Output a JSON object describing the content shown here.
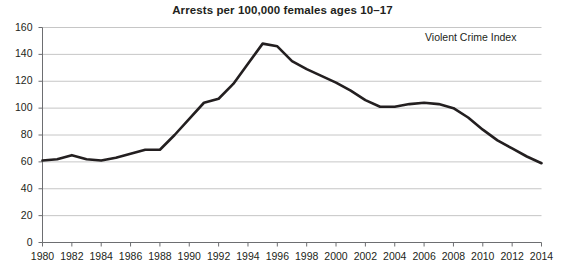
{
  "chart_data": {
    "type": "line",
    "title": "Arrests per 100,000 females ages 10–17",
    "xlabel": "",
    "ylabel": "",
    "xlim": [
      1980,
      2014
    ],
    "ylim": [
      0,
      160
    ],
    "grid": true,
    "legend_position": "top-right",
    "legend": [
      "Violent Crime Index"
    ],
    "series": [
      {
        "name": "Violent Crime Index",
        "color": "#231f20",
        "x": [
          1980,
          1981,
          1982,
          1983,
          1984,
          1985,
          1986,
          1987,
          1988,
          1989,
          1990,
          1991,
          1992,
          1993,
          1994,
          1995,
          1996,
          1997,
          1998,
          1999,
          2000,
          2001,
          2002,
          2003,
          2004,
          2005,
          2006,
          2007,
          2008,
          2009,
          2010,
          2011,
          2012,
          2013,
          2014
        ],
        "values": [
          61,
          62,
          65,
          62,
          61,
          63,
          66,
          69,
          69,
          80,
          92,
          104,
          107,
          118,
          133,
          148,
          146,
          135,
          129,
          124,
          119,
          113,
          106,
          101,
          101,
          103,
          104,
          103,
          100,
          93,
          84,
          76,
          70,
          64,
          59
        ]
      }
    ],
    "x_ticks": [
      1980,
      1982,
      1984,
      1986,
      1988,
      1990,
      1992,
      1994,
      1996,
      1998,
      2000,
      2002,
      2004,
      2006,
      2008,
      2010,
      2012,
      2014
    ],
    "x_tick_labels": [
      "1980",
      "1982",
      "1984",
      "1986",
      "1988",
      "1990",
      "1992",
      "1994",
      "1996",
      "1998",
      "2000",
      "2002",
      "2004",
      "2006",
      "2008",
      "2010",
      "2012",
      "2014"
    ],
    "y_ticks": [
      0,
      20,
      40,
      60,
      80,
      100,
      120,
      140,
      160
    ],
    "y_tick_labels": [
      "0",
      "20",
      "40",
      "60",
      "80",
      "100",
      "120",
      "140",
      "160"
    ],
    "colors": {
      "line": "#231f20",
      "grid": "#b8b8b8",
      "axis": "#6d6e71",
      "text": "#231f20",
      "background": "#ffffff"
    }
  }
}
